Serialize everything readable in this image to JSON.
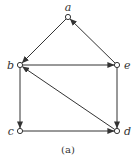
{
  "figure": {
    "caption": "(a)",
    "nodes": [
      {
        "id": "a",
        "label": "a",
        "x": 68,
        "y": 17
      },
      {
        "id": "b",
        "label": "b",
        "x": 20,
        "y": 65
      },
      {
        "id": "e",
        "label": "e",
        "x": 117,
        "y": 65
      },
      {
        "id": "c",
        "label": "c",
        "x": 20,
        "y": 131
      },
      {
        "id": "d",
        "label": "d",
        "x": 117,
        "y": 131
      }
    ],
    "edges": [
      {
        "from": "a",
        "to": "b"
      },
      {
        "from": "e",
        "to": "a"
      },
      {
        "from": "b",
        "to": "e"
      },
      {
        "from": "b",
        "to": "c"
      },
      {
        "from": "e",
        "to": "d"
      },
      {
        "from": "c",
        "to": "d"
      },
      {
        "from": "d",
        "to": "b"
      }
    ],
    "colors": {
      "line": "#333333",
      "node_fill": "#ffffff"
    }
  }
}
